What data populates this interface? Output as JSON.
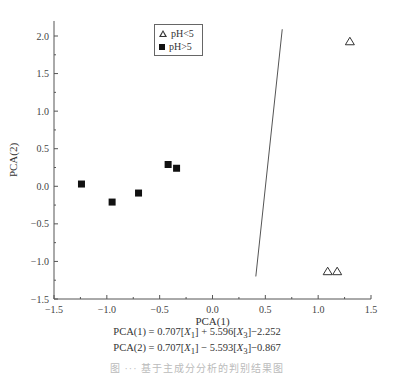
{
  "chart_data": {
    "type": "scatter",
    "title": "",
    "xlabel": "PCA(1)",
    "ylabel": "PCA(2)",
    "xlim": [
      -1.5,
      1.5
    ],
    "ylim": [
      -1.5,
      2.2
    ],
    "x_ticks": [
      "-1.5",
      "-1.0",
      "-0.5",
      "0.0",
      "0.5",
      "1.0",
      "1.5"
    ],
    "y_ticks": [
      "-1.5",
      "-1.0",
      "-0.5",
      "0.0",
      "0.5",
      "1.0",
      "1.5",
      "2.0"
    ],
    "grid": false,
    "legend_position": "upper-left-center",
    "series": [
      {
        "name": "pH<5",
        "marker": "open-triangle",
        "points": [
          [
            1.3,
            1.93
          ],
          [
            1.09,
            -1.13
          ],
          [
            1.18,
            -1.13
          ]
        ]
      },
      {
        "name": "pH>5",
        "marker": "filled-square",
        "points": [
          [
            -1.24,
            0.03
          ],
          [
            -0.95,
            -0.21
          ],
          [
            -0.7,
            -0.09
          ],
          [
            -0.42,
            0.29
          ],
          [
            -0.34,
            0.24
          ]
        ]
      }
    ],
    "annotations": [
      {
        "type": "line",
        "label": "discriminant line",
        "from": [
          0.41,
          -1.2
        ],
        "to": [
          0.66,
          2.09
        ]
      }
    ],
    "equations": [
      "PCA(1) = 0.707[X1] + 5.596[X3]−2.252",
      "PCA(2) = 0.707[X1] − 5.593[X3]−0.867"
    ]
  },
  "legend": {
    "items": [
      {
        "label": "pH<5",
        "icon": "open-triangle-icon"
      },
      {
        "label": "pH>5",
        "icon": "filled-square-icon"
      }
    ]
  },
  "equations": {
    "eq1": {
      "lhs": "PCA(1) = 0.707[",
      "v1": "X",
      "s1": "1",
      "mid": "] + 5.596[",
      "v2": "X",
      "s2": "3",
      "rhs": "]−2.252"
    },
    "eq2": {
      "lhs": "PCA(2) = 0.707[",
      "v1": "X",
      "s1": "1",
      "mid": "] − 5.593[",
      "v2": "X",
      "s2": "3",
      "rhs": "]−0.867"
    }
  },
  "caption": "图 ··· 基于主成分分析的判别结果图"
}
